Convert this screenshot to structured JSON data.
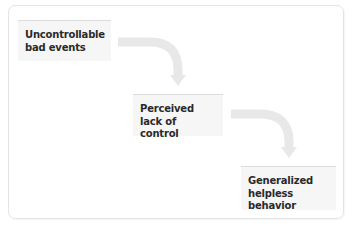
{
  "diagram": {
    "type": "flowchart",
    "direction": "diagonal-top-left-to-bottom-right",
    "nodes": [
      {
        "id": "node1",
        "label": "Uncontrollable\nbad events"
      },
      {
        "id": "node2",
        "label": "Perceived\nlack of control"
      },
      {
        "id": "node3",
        "label": "Generalized\nhelpless behavior"
      }
    ],
    "edges": [
      {
        "from": "node1",
        "to": "node2"
      },
      {
        "from": "node2",
        "to": "node3"
      }
    ]
  },
  "colors": {
    "node_background": "#f6f6f6",
    "node_top_border": "#dcdcdc",
    "arrow": "#e8e8e8",
    "frame_border": "#e4e4e4",
    "text": "#2a2a2a"
  }
}
